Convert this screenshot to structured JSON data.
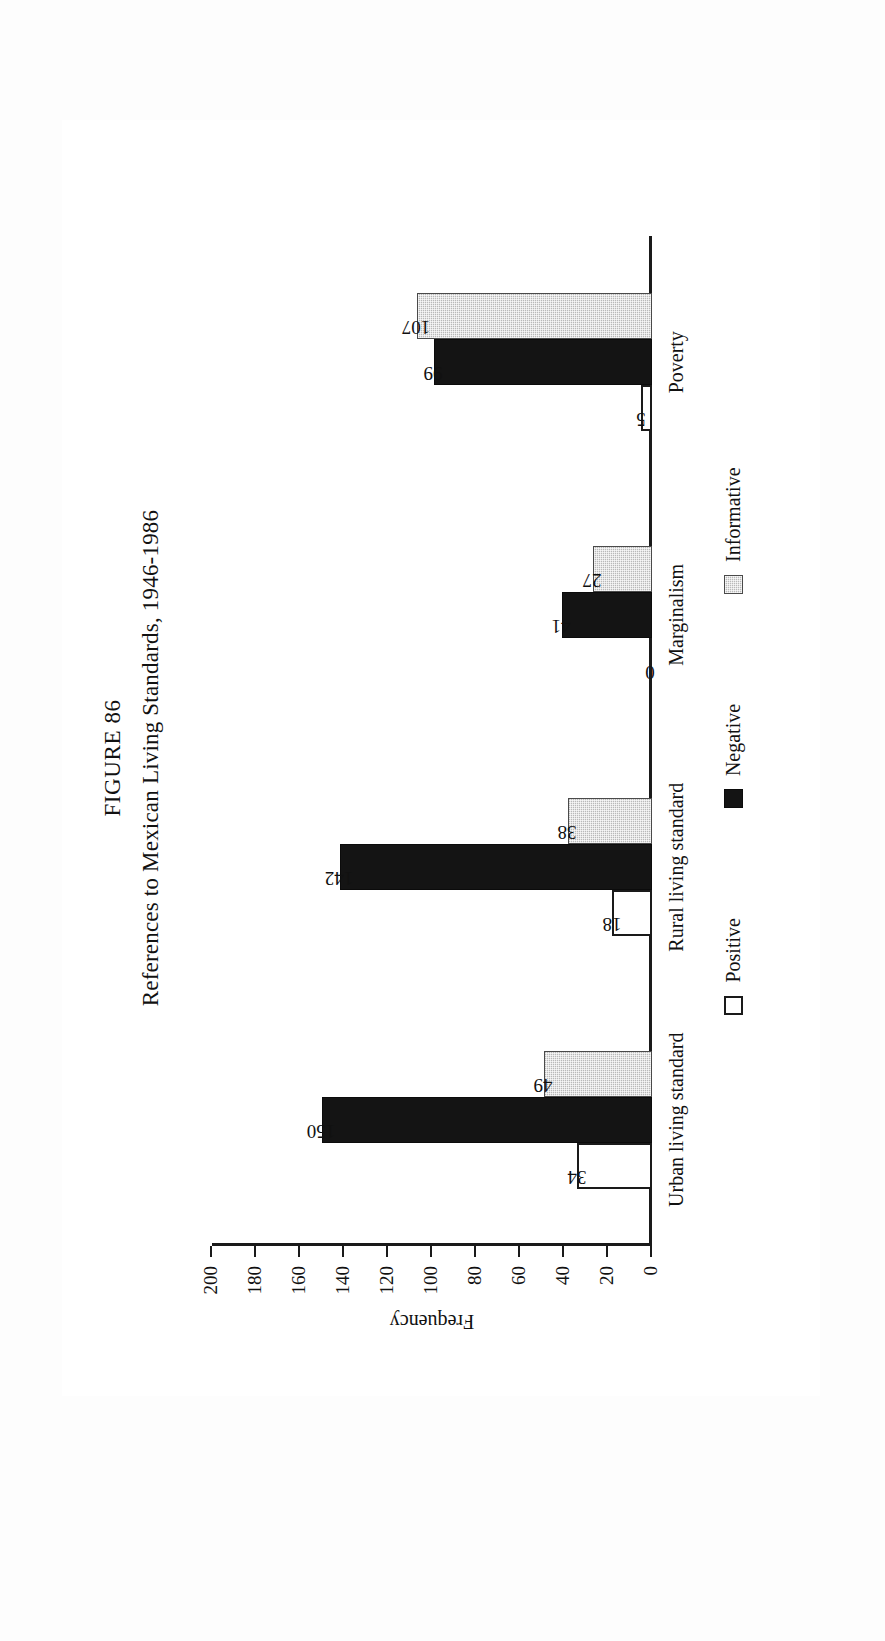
{
  "figure": {
    "label": "FIGURE 86",
    "caption": "References to Mexican Living Standards, 1946-1986"
  },
  "chart_data": {
    "type": "bar",
    "title": "References to Mexican Living Standards, 1946-1986",
    "subtitle": "FIGURE 86",
    "orientation": "vertical",
    "grid": false,
    "legend_position": "bottom",
    "xlabel": "",
    "ylabel": "Frequency",
    "ylim": [
      0,
      200
    ],
    "yticks": [
      "0",
      "20",
      "40",
      "60",
      "80",
      "100",
      "120",
      "140",
      "160",
      "180",
      "200"
    ],
    "categories": [
      "Urban living standard",
      "Rural living standard",
      "Marginalism",
      "Poverty"
    ],
    "series": [
      {
        "name": "Positive",
        "values": [
          34,
          18,
          0,
          5
        ],
        "color": "#ffffff"
      },
      {
        "name": "Negative",
        "values": [
          150,
          142,
          41,
          99
        ],
        "color": "#141414"
      },
      {
        "name": "Informative",
        "values": [
          49,
          38,
          27,
          107
        ],
        "color": "#b9b9b9"
      }
    ]
  },
  "axis": {
    "y_label": "Frequency",
    "y_ticks": [
      "200",
      "180",
      "160",
      "140",
      "120",
      "100",
      "80",
      "60",
      "40",
      "20",
      "0"
    ]
  },
  "legend": {
    "items": [
      {
        "label": "Positive",
        "swatch": "positive"
      },
      {
        "label": "Negative",
        "swatch": "negative"
      },
      {
        "label": "Informative",
        "swatch": "informative"
      }
    ]
  },
  "categories": [
    {
      "name": "Urban living standard",
      "bars": [
        {
          "series": "Positive",
          "value": "34",
          "n": 34,
          "style": "positive"
        },
        {
          "series": "Negative",
          "value": "150",
          "n": 150,
          "style": "negative"
        },
        {
          "series": "Informative",
          "value": "49",
          "n": 49,
          "style": "informative"
        }
      ]
    },
    {
      "name": "Rural living standard",
      "bars": [
        {
          "series": "Positive",
          "value": "18",
          "n": 18,
          "style": "positive"
        },
        {
          "series": "Negative",
          "value": "142",
          "n": 142,
          "style": "negative"
        },
        {
          "series": "Informative",
          "value": "38",
          "n": 38,
          "style": "informative"
        }
      ]
    },
    {
      "name": "Marginalism",
      "bars": [
        {
          "series": "Positive",
          "value": "0",
          "n": 0,
          "style": "positive"
        },
        {
          "series": "Negative",
          "value": "41",
          "n": 41,
          "style": "negative"
        },
        {
          "series": "Informative",
          "value": "27",
          "n": 27,
          "style": "informative"
        }
      ]
    },
    {
      "name": "Poverty",
      "bars": [
        {
          "series": "Positive",
          "value": "5",
          "n": 5,
          "style": "positive"
        },
        {
          "series": "Negative",
          "value": "99",
          "n": 99,
          "style": "negative"
        },
        {
          "series": "Informative",
          "value": "107",
          "n": 107,
          "style": "informative"
        }
      ]
    }
  ]
}
